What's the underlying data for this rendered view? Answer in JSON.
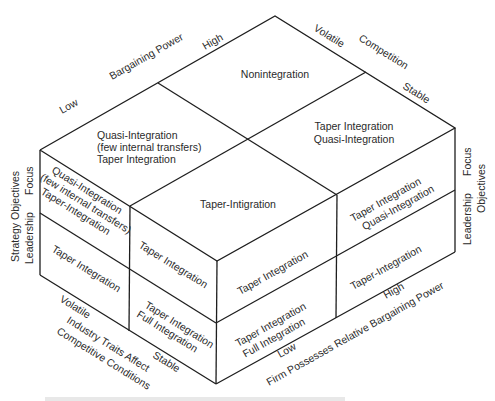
{
  "diagram": {
    "type": "3d-cube-matrix",
    "top_face": {
      "axis_back_left": {
        "title": "Bargaining Power",
        "low": "Low",
        "high": "High"
      },
      "axis_back_right": {
        "title": "Competition",
        "volatile": "Volatile",
        "stable": "Stable"
      },
      "cells": {
        "back": "Nonintegration",
        "left": [
          "Quasi-Integration",
          "(few internal transfers)",
          "Taper Integration"
        ],
        "right": [
          "Taper Integration",
          "Quasi-Integration"
        ],
        "front": "Taper-Intigration"
      }
    },
    "left_face": {
      "axis_vertical": {
        "title": "Strategy Objectives",
        "top": "Focus",
        "bottom": "Leadership"
      },
      "axis_bottom": {
        "title_line1": "Industry Traits Affect",
        "title_line2": "Competitive Conditions",
        "volatile": "Volatile",
        "stable": "Stable"
      },
      "cells": {
        "top_left": [
          "Quasi-Integration",
          "(few internal transfers)",
          "Taper-Integration"
        ],
        "bottom_left": "Taper Integration",
        "top_right": "Taper Integration",
        "bottom_right": [
          "Taper Integration",
          "Full Integration"
        ]
      }
    },
    "right_face": {
      "axis_vertical": {
        "title": "Objectives",
        "top": "Focus",
        "bottom": "Leadership"
      },
      "axis_bottom": {
        "title": "Firm Possesses Relative Bargaining Power",
        "low": "Low",
        "high": "High"
      },
      "cells": {
        "top_left": "Taper Integration",
        "top_right": [
          "Taper Integration",
          "Quasi-Integration"
        ],
        "bottom_left": [
          "Taper Integration",
          "Full Integration"
        ],
        "bottom_right": "Taper-Integration"
      }
    }
  }
}
